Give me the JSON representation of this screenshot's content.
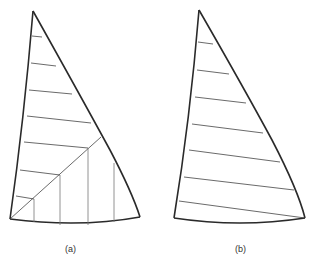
{
  "figure": {
    "panels": [
      {
        "id": "a",
        "caption": "(a)",
        "description": "Sail outline with horizontal seams above a diagonal and vertical seams below it",
        "horizontal_seams": 7,
        "vertical_seams": 4,
        "has_diagonal": true
      },
      {
        "id": "b",
        "caption": "(b)",
        "description": "Sail outline with horizontal (cross-cut) seams only",
        "horizontal_seams": 7,
        "vertical_seams": 0,
        "has_diagonal": false
      }
    ]
  }
}
